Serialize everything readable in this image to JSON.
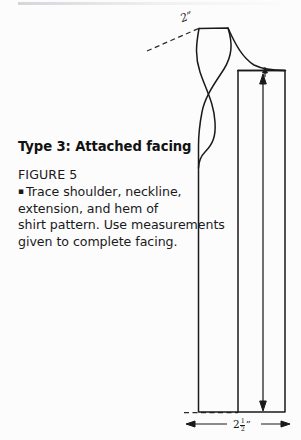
{
  "document": {
    "type": "sewing-pattern-instruction-page",
    "background_color": "#fcfcfc",
    "ink_color": "#191919"
  },
  "text_block": {
    "heading": "Type 3: Attached facing",
    "figure_label": "FIGURE 5",
    "bullet_glyph": "▪",
    "caption_lines": [
      "Trace shoulder, neckline,",
      "extension, and hem of",
      "shirt pattern. Use measurements",
      "given to complete facing."
    ],
    "caption_full": "Trace shoulder, neckline, extension, and hem of shirt pattern. Use measurements given to complete facing."
  },
  "diagram": {
    "name": "attached-facing-pattern-piece",
    "dimensions": [
      {
        "id": "shoulder-width",
        "value": "2",
        "unit_mark": "\"",
        "display": "2\"",
        "position": "top-left, along dashed shoulder line"
      },
      {
        "id": "facing-width",
        "whole": "2",
        "numerator": "1",
        "denominator": "2",
        "unit_mark": "\"",
        "display": "2 1/2\"",
        "position": "bottom, below hem between arrows"
      }
    ],
    "guides": [
      {
        "id": "shoulder-guide",
        "style": "dashed",
        "note": "extends left-down from shoulder point"
      },
      {
        "id": "hem-guide",
        "style": "dashed",
        "note": "extends left from hem at bottom"
      }
    ],
    "arrows": [
      {
        "id": "grainline-arrow",
        "style": "double-headed vertical",
        "note": "runs full length of facing piece"
      },
      {
        "id": "width-arrow",
        "style": "double-headed horizontal",
        "note": "spans facing width at hem"
      },
      {
        "id": "top-tick-arrow",
        "style": "single up arrow",
        "note": "small arrow at top right edge"
      }
    ]
  }
}
